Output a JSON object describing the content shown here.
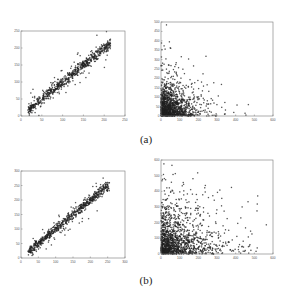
{
  "figure": {
    "captions": [
      "(a)",
      "(b)"
    ]
  },
  "chart_data": [
    {
      "type": "scatter",
      "panel": "(a) left",
      "title": "",
      "xlabel": "",
      "ylabel": "",
      "xlim": [
        0,
        250
      ],
      "ylim": [
        0,
        250
      ],
      "xticks": [
        0,
        50,
        100,
        150,
        200,
        250
      ],
      "yticks": [
        0,
        50,
        100,
        150,
        200,
        250
      ],
      "grid": false,
      "description": "Dense points along diagonal y≈x from ~15 to ~215",
      "trend": {
        "slope": 1.0,
        "intercept": 0,
        "x_range": [
          15,
          215
        ],
        "spread": 8,
        "outlier_spread": 25,
        "n": 700,
        "seed": 11
      }
    },
    {
      "type": "scatter",
      "panel": "(a) right",
      "title": "",
      "xlabel": "",
      "ylabel": "",
      "xlim": [
        0,
        600
      ],
      "ylim": [
        0,
        500
      ],
      "xticks": [
        0,
        100,
        200,
        300,
        400,
        500,
        600
      ],
      "yticks": [
        0,
        50,
        100,
        150,
        200,
        250,
        300,
        350,
        400,
        450,
        500
      ],
      "grid": false,
      "description": "Points concentrated near origin, sparse tail to x≈500, y≈500",
      "cluster": {
        "x_scale": 70,
        "y_scale": 60,
        "n": 1400,
        "seed": 23
      }
    },
    {
      "type": "scatter",
      "panel": "(b) left",
      "title": "",
      "xlabel": "",
      "ylabel": "",
      "xlim": [
        0,
        300
      ],
      "ylim": [
        0,
        300
      ],
      "xticks": [
        0,
        50,
        100,
        150,
        200,
        250,
        300
      ],
      "yticks": [
        0,
        50,
        100,
        150,
        200,
        250,
        300
      ],
      "grid": false,
      "description": "Dense points along diagonal y≈x from ~20 to ~255",
      "trend": {
        "slope": 1.0,
        "intercept": 0,
        "x_range": [
          20,
          255
        ],
        "spread": 8,
        "outlier_spread": 25,
        "n": 700,
        "seed": 37
      }
    },
    {
      "type": "scatter",
      "panel": "(b) right",
      "title": "",
      "xlabel": "",
      "ylabel": "",
      "xlim": [
        0,
        600
      ],
      "ylim": [
        0,
        600
      ],
      "xticks": [
        0,
        100,
        200,
        300,
        400,
        500,
        600
      ],
      "yticks": [
        0,
        100,
        200,
        300,
        400,
        500,
        600
      ],
      "grid": false,
      "description": "Points concentrated near origin, wider spread to x≈580, y≈570",
      "cluster": {
        "x_scale": 100,
        "y_scale": 110,
        "n": 1400,
        "seed": 41
      }
    }
  ]
}
